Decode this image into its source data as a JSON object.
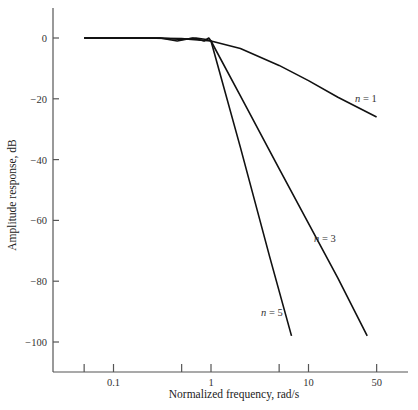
{
  "chart_data": {
    "type": "line",
    "title": "",
    "xlabel": "Normalized frequency, rad/s",
    "ylabel": "Amplitude response, dB",
    "xscale": "log",
    "x_ticks": [
      0.05,
      0.1,
      0.5,
      1,
      5,
      10,
      50
    ],
    "x_tick_labels": [
      "",
      "0.1",
      "",
      "1",
      "",
      "10",
      "50"
    ],
    "y_ticks": [
      0,
      -20,
      -40,
      -60,
      -80,
      -100
    ],
    "y_tick_labels": [
      "0",
      "−20",
      "−40",
      "−60",
      "−80",
      "−100"
    ],
    "xlim": [
      0.024,
      150
    ],
    "ylim": [
      -110,
      10
    ],
    "grid": false,
    "legend": "inline labels",
    "series": [
      {
        "name": "n = 1",
        "label_n": "n",
        "label_rest": " = 1",
        "x": [
          0.05,
          0.2,
          0.5,
          1,
          2,
          5,
          10,
          20,
          50
        ],
        "y": [
          0,
          0,
          -0.2,
          -1,
          -3.5,
          -9,
          -14,
          -19.5,
          -26
        ]
      },
      {
        "name": "n = 3",
        "label_n": "n",
        "label_rest": " = 3",
        "x": [
          0.05,
          0.3,
          0.5,
          0.7,
          0.9,
          1,
          2,
          5,
          10,
          20,
          40
        ],
        "y": [
          0,
          0,
          -0.5,
          0,
          -0.5,
          -1,
          -19,
          -43,
          -61,
          -79,
          -98
        ]
      },
      {
        "name": "n = 5",
        "label_n": "n",
        "label_rest": " = 5",
        "x": [
          0.05,
          0.3,
          0.45,
          0.65,
          0.85,
          0.95,
          1,
          2,
          4,
          6.7
        ],
        "y": [
          0,
          0,
          -1,
          0,
          -1,
          0,
          -1,
          -36,
          -72,
          -98
        ]
      }
    ]
  },
  "caption_partial": "Figure 4.10 (Continued) Amplitude response of Chebyshev filters"
}
